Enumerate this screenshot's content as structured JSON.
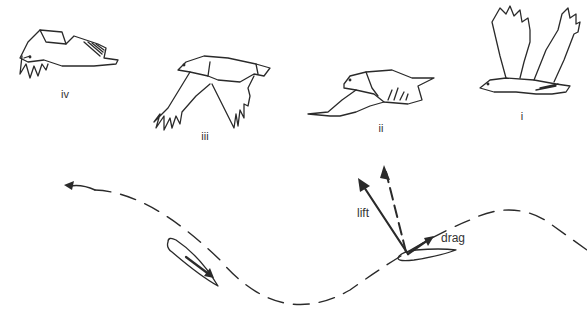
{
  "figure": {
    "type": "bird-flight-sequence",
    "stages": [
      {
        "id": "iv",
        "label": "iv",
        "x": 65,
        "y": 68
      },
      {
        "id": "iii",
        "label": "iii",
        "x": 205,
        "y": 130
      },
      {
        "id": "ii",
        "label": "ii",
        "x": 381,
        "y": 125
      },
      {
        "id": "i",
        "label": "i",
        "x": 522,
        "y": 111
      }
    ],
    "forces": {
      "lift_label": "lift",
      "drag_label": "drag"
    },
    "colors": {
      "line": "#2a2a2a",
      "background": "#ffffff"
    }
  }
}
